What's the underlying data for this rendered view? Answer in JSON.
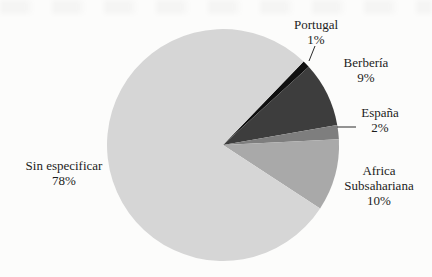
{
  "figure": {
    "background_color": "#fcfcfb",
    "text_color": "#1c1c1c",
    "leader_line_color": "#2a2a2a"
  },
  "chart_data": {
    "type": "pie",
    "title": "",
    "unit": "%",
    "categories": [
      "Portugal",
      "Berbería",
      "España",
      "Africa Subsahariana",
      "Sin especificar"
    ],
    "values": [
      1,
      9,
      2,
      10,
      78
    ],
    "start_angle_deg": 44,
    "direction": "clockwise",
    "legend_position": "none",
    "labels_outside": true,
    "slices": [
      {
        "label": "Portugal",
        "value": 1,
        "pct": "1%",
        "color": "#101010",
        "label_lines": [
          "Portugal",
          "1%"
        ]
      },
      {
        "label": "Berbería",
        "value": 9,
        "pct": "9%",
        "color": "#3d3d3d",
        "label_lines": [
          "Berbería",
          "9%"
        ]
      },
      {
        "label": "España",
        "value": 2,
        "pct": "2%",
        "color": "#7e7e7e",
        "label_lines": [
          "España",
          "2%"
        ]
      },
      {
        "label": "Africa Subsahariana",
        "value": 10,
        "pct": "10%",
        "color": "#a9a9a9",
        "label_lines": [
          "Africa",
          "Subsahariana",
          "10%"
        ]
      },
      {
        "label": "Sin especificar",
        "value": 78,
        "pct": "78%",
        "color": "#d6d6d6",
        "label_lines": [
          "Sin especificar",
          "78%"
        ]
      }
    ]
  }
}
